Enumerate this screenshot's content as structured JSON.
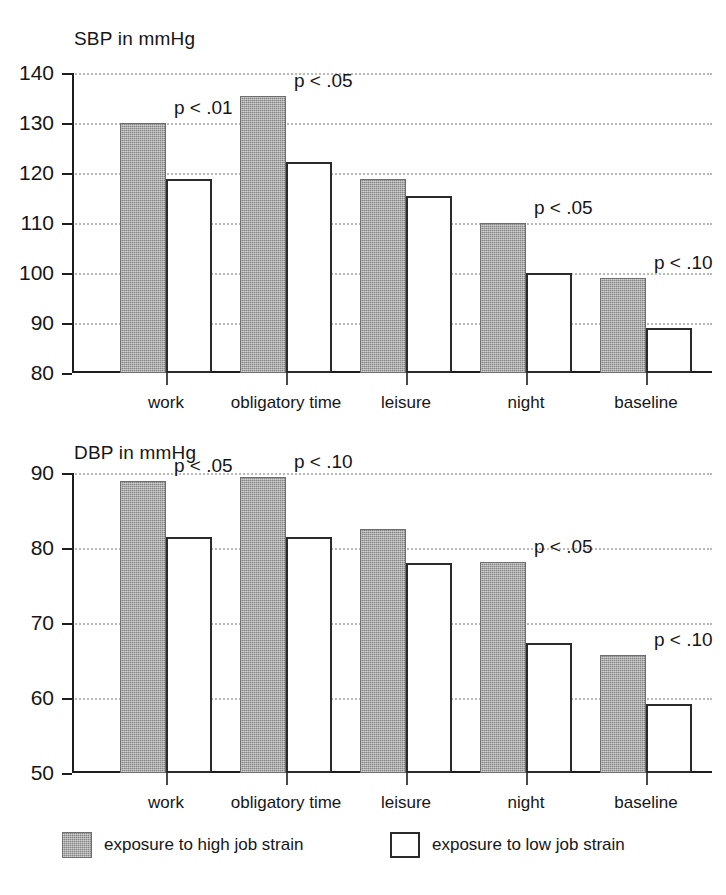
{
  "figure": {
    "legend": {
      "entries": [
        {
          "key": "high",
          "label": "exposure to high job strain"
        },
        {
          "key": "low",
          "label": "exposure to low job strain"
        }
      ]
    }
  },
  "chart_data": [
    {
      "type": "bar",
      "id": "sbp",
      "title": "SBP in mmHg",
      "xlabel": "",
      "ylabel": "SBP in mmHg",
      "ylim": [
        80,
        140
      ],
      "yticks": [
        80,
        90,
        100,
        110,
        120,
        130,
        140
      ],
      "grid": true,
      "legend_position": "bottom",
      "categories": [
        "work",
        "obligatory time",
        "leisure",
        "night",
        "baseline"
      ],
      "series": [
        {
          "name": "exposure to high job strain",
          "values": [
            130.0,
            135.5,
            118.9,
            110.0,
            99.0
          ]
        },
        {
          "name": "exposure to low job strain",
          "values": [
            118.8,
            122.3,
            115.5,
            100.0,
            89.0
          ]
        }
      ],
      "annotations": [
        {
          "category": "work",
          "text": "p < .01"
        },
        {
          "category": "obligatory time",
          "text": "p < .05"
        },
        {
          "category": "night",
          "text": "p < .05"
        },
        {
          "category": "baseline",
          "text": "p < .10"
        }
      ]
    },
    {
      "type": "bar",
      "id": "dbp",
      "title": "DBP in mmHg",
      "xlabel": "",
      "ylabel": "DBP in mmHg",
      "ylim": [
        50,
        90
      ],
      "yticks": [
        50,
        60,
        70,
        80,
        90
      ],
      "grid": true,
      "legend_position": "bottom",
      "categories": [
        "work",
        "obligatory time",
        "leisure",
        "night",
        "baseline"
      ],
      "series": [
        {
          "name": "exposure to high job strain",
          "values": [
            88.9,
            89.5,
            82.5,
            78.2,
            65.7
          ]
        },
        {
          "name": "exposure to low job strain",
          "values": [
            81.5,
            81.5,
            78.0,
            67.3,
            59.2
          ]
        }
      ],
      "annotations": [
        {
          "category": "work",
          "text": "p < .05"
        },
        {
          "category": "obligatory time",
          "text": "p < .10"
        },
        {
          "category": "night",
          "text": "p < .05"
        },
        {
          "category": "baseline",
          "text": "p < .10"
        }
      ]
    }
  ]
}
